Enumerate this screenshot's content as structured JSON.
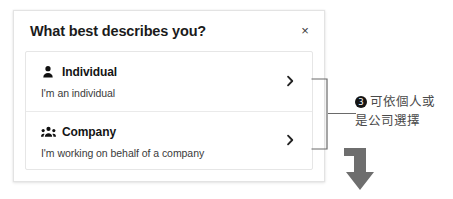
{
  "dialog": {
    "title": "What best describes you?",
    "close_label": "×",
    "close_icon": "close-icon",
    "options": [
      {
        "icon": "person-icon",
        "title": "Individual",
        "subtitle": "I'm an individual",
        "chevron_icon": "chevron-right-icon"
      },
      {
        "icon": "people-group-icon",
        "title": "Company",
        "subtitle": "I'm working on behalf of a company",
        "chevron_icon": "chevron-right-icon"
      }
    ]
  },
  "annotation": {
    "badge": "3",
    "line1": "可依個人或",
    "line2": "是公司選擇",
    "bracket_icon": "bracket-connector",
    "arrow_icon": "bent-down-arrow-icon"
  },
  "colors": {
    "dialog_border": "#e3e3e3",
    "card_border": "#e6e6e6",
    "divider": "#eaeaea",
    "title_text": "#1b1b1b",
    "body_text": "#3a3a3a",
    "annotation_text": "#4a4a4a",
    "badge_bg": "#141414",
    "connector": "#6a6a6a",
    "arrow_fill": "#6e6e6e"
  }
}
